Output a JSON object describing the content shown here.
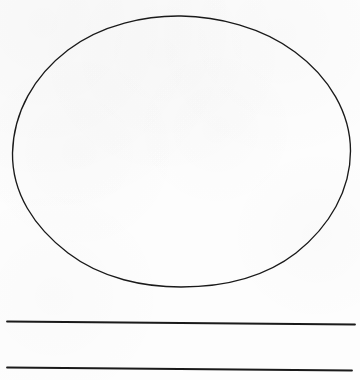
{
  "document": {
    "kind": "scanned-line-drawing",
    "title": "",
    "background_color": "#fdfdfd",
    "ink_color": "#1a1a1a",
    "width": 360,
    "height": 380
  },
  "shapes": {
    "ellipse": {
      "name": "ellipse-outline",
      "center_x": 181,
      "center_y": 151,
      "radius_x": 169,
      "radius_y": 135,
      "left": 12,
      "right": 351,
      "top": 16,
      "bottom": 287,
      "stroke_color": "#1a1a1a",
      "stroke_width": 1.35,
      "fill": "none",
      "path": "M 12.5 153 C 13.5 112 34 76 68 50 C 102 24 147 15.5 181 16 C 217 16.5 262 27 295 52 C 329 77 350.5 113 350.5 151 C 350.5 190 330 226 296 253 C 261 280 218 287 181 287 C 145 287 102 279 68 253 C 34 227 12 193 12.5 153 Z"
    },
    "lines": [
      {
        "name": "horizontal-rule-upper",
        "x1": 7,
        "y1": 321.5,
        "x2": 355,
        "y2": 324.5,
        "stroke_color": "#1a1a1a",
        "stroke_width": 1.8
      },
      {
        "name": "horizontal-rule-lower",
        "x1": 7,
        "y1": 367.5,
        "x2": 352,
        "y2": 370.5,
        "stroke_color": "#1a1a1a",
        "stroke_width": 1.8
      }
    ]
  },
  "labels": {
    "ellipse_label": "",
    "upper_line_label": "",
    "lower_line_label": ""
  }
}
